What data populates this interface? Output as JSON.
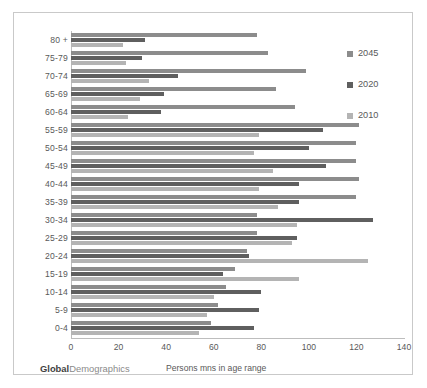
{
  "chart_data": {
    "type": "bar",
    "orientation": "horizontal",
    "title": "",
    "xlabel": "Persons mns in age range",
    "ylabel": "",
    "xlim": [
      0,
      140
    ],
    "xticks": [
      0,
      20,
      40,
      60,
      80,
      100,
      120,
      140
    ],
    "grid": false,
    "legend_position": "right",
    "categories": [
      "80 +",
      "75-79",
      "70-74",
      "65-69",
      "60-64",
      "55-59",
      "50-54",
      "45-49",
      "40-44",
      "35-39",
      "30-34",
      "25-29",
      "20-24",
      "15-19",
      "10-14",
      "5-9",
      "0-4"
    ],
    "series": [
      {
        "name": "2045",
        "color": "#8c8c8c",
        "values": [
          78,
          83,
          99,
          86,
          94,
          121,
          120,
          120,
          121,
          120,
          78,
          78,
          74,
          69,
          65,
          62,
          59
        ]
      },
      {
        "name": "2020",
        "color": "#5f5f5f",
        "values": [
          31,
          30,
          45,
          39,
          38,
          106,
          100,
          107,
          96,
          96,
          127,
          95,
          75,
          64,
          80,
          79,
          77
        ]
      },
      {
        "name": "2010",
        "color": "#b4b4b4",
        "values": [
          22,
          23,
          33,
          29,
          24,
          79,
          77,
          85,
          79,
          87,
          95,
          93,
          125,
          96,
          60,
          57,
          54
        ]
      }
    ]
  },
  "legend": {
    "items": [
      {
        "label": "2045",
        "color": "#8c8c8c"
      },
      {
        "label": "2020",
        "color": "#5f5f5f"
      },
      {
        "label": "2010",
        "color": "#b4b4b4"
      }
    ]
  },
  "watermark": {
    "bold_part": "Global",
    "light_part": "Demographics"
  }
}
